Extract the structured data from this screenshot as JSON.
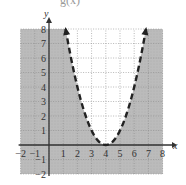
{
  "chart_data": {
    "type": "line",
    "title": "",
    "cropped_header_fragment": "g(x)",
    "xlabel": "x",
    "ylabel": "y",
    "xlim": [
      -2,
      8
    ],
    "ylim": [
      -2,
      8
    ],
    "grid": true,
    "x_ticks": [
      "-2",
      "-1",
      "1",
      "2",
      "3",
      "4",
      "5",
      "6",
      "7",
      "8"
    ],
    "y_ticks": [
      "-2",
      "-1",
      "1",
      "2",
      "3",
      "4",
      "5",
      "6",
      "7",
      "8"
    ],
    "series": [
      {
        "name": "boundary y = (x - 4)^2",
        "style": "dashed",
        "vertex": [
          4,
          0
        ],
        "x": [
          1.17,
          2,
          3,
          4,
          5,
          6,
          6.83
        ],
        "y": [
          8,
          4,
          1,
          0,
          1,
          4,
          8
        ],
        "arrows": "both ends"
      }
    ],
    "shading": {
      "region": "outside parabola (below curve)",
      "inequality": "y < (x - 4)^2",
      "color": "#b8b8b8"
    }
  },
  "labels": {
    "x_axis": "x",
    "y_axis": "y",
    "header_fragment": "g(x)"
  }
}
